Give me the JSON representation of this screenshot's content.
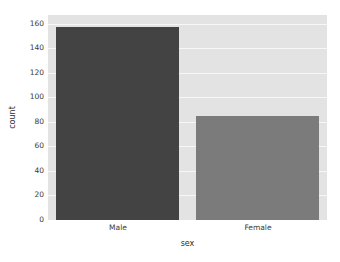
{
  "chart_data": {
    "type": "bar",
    "title": "",
    "subtitle": "",
    "xlabel": "sex",
    "ylabel": "count",
    "categories": [
      "Male",
      "Female"
    ],
    "values": [
      157,
      85
    ],
    "series": [
      {
        "name": "count",
        "values": [
          157,
          85
        ]
      }
    ],
    "bar_colors": [
      "#434343",
      "#7b7b7b"
    ],
    "ylim": [
      0,
      167
    ],
    "yticks": [
      0,
      20,
      40,
      60,
      80,
      100,
      120,
      140,
      160
    ],
    "ytick_labels": [
      "0",
      "20",
      "40",
      "60",
      "80",
      "100",
      "120",
      "140",
      "160"
    ],
    "xtick_labels": [
      "Male",
      "Female"
    ],
    "grid": true,
    "grid_axis": "y",
    "grid_color": "#f7f7f7",
    "legend": false,
    "legend_position": "none",
    "plot_background": "#e3e3e3",
    "figure_background": "#ffffff",
    "tick_label_color": "#3a3a3a",
    "axis_label_color": "#2b2b2b"
  }
}
